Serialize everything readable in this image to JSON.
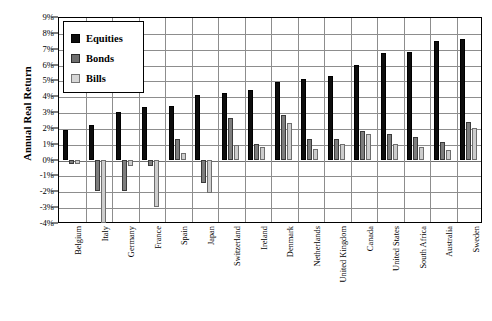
{
  "chart_data": {
    "type": "bar",
    "title": "",
    "xlabel": "",
    "ylabel": "Annual Real Return",
    "ylim": [
      -4,
      9
    ],
    "ytick_step": 1,
    "grid": true,
    "legend_position": "top-left",
    "ytick_labels": [
      "9%",
      "8%",
      "7%",
      "6%",
      "5%",
      "4%",
      "3%",
      "2%",
      "1%",
      "0%",
      "-1%",
      "-2%",
      "-3%",
      "-4%"
    ],
    "ytick_values": [
      9,
      8,
      7,
      6,
      5,
      4,
      3,
      2,
      1,
      0,
      -1,
      -2,
      -3,
      -4
    ],
    "categories": [
      "Belgium",
      "Italy",
      "Germany",
      "France",
      "Spain",
      "Japan",
      "Switzerland",
      "Ireland",
      "Denmark",
      "Netherlands",
      "United Kingdom",
      "Canada",
      "United States",
      "South Africa",
      "Australia",
      "Sweden"
    ],
    "series": [
      {
        "name": "Equities",
        "color": "#0d0d0d",
        "values": [
          1.9,
          2.2,
          3.0,
          3.3,
          3.4,
          4.1,
          4.2,
          4.4,
          4.9,
          5.1,
          5.3,
          6.0,
          6.7,
          6.8,
          7.5,
          7.6
        ]
      },
      {
        "name": "Bonds",
        "color": "#7d7d7d",
        "values": [
          -0.3,
          -2.0,
          -2.0,
          -0.4,
          1.3,
          -1.5,
          2.6,
          1.0,
          2.8,
          1.3,
          1.3,
          1.8,
          1.6,
          1.4,
          1.1,
          2.4
        ]
      },
      {
        "name": "Bills",
        "color": "#cdcdcd",
        "values": [
          -0.3,
          -4.0,
          -0.4,
          -3.0,
          0.4,
          -2.1,
          0.9,
          0.8,
          2.3,
          0.7,
          1.0,
          1.6,
          1.0,
          0.8,
          0.6,
          2.0
        ]
      }
    ]
  },
  "legend": {
    "items": [
      {
        "label": "Equities",
        "swatch": "equities"
      },
      {
        "label": "Bonds",
        "swatch": "bonds"
      },
      {
        "label": "Bills",
        "swatch": "bills"
      }
    ]
  },
  "axis": {
    "y_title": "Annual Real Return"
  }
}
